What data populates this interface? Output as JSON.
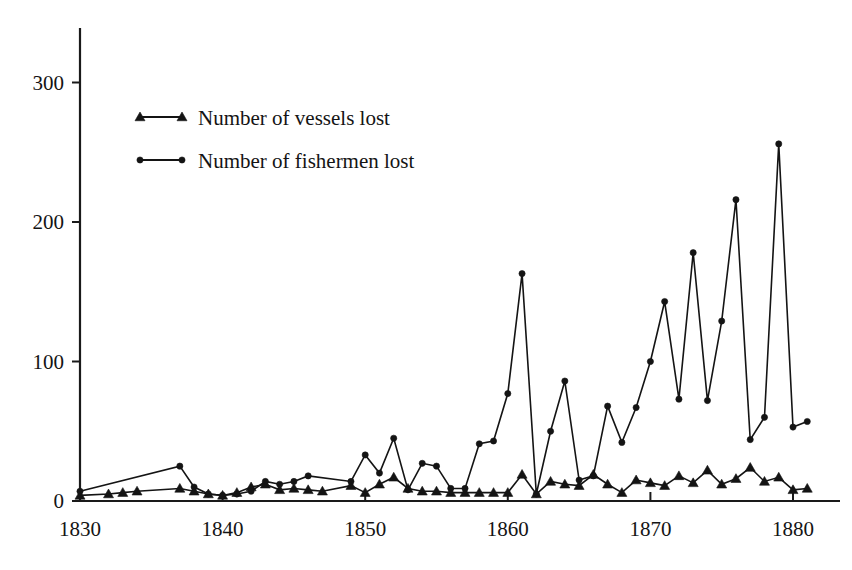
{
  "chart_data": {
    "type": "line",
    "title": "",
    "subtitle": "",
    "xlabel": "",
    "ylabel": "",
    "xlim": [
      1829,
      1882
    ],
    "ylim": [
      0,
      335
    ],
    "grid": false,
    "legend_position": "top-left-inside",
    "x_ticks": [
      1830,
      1840,
      1850,
      1860,
      1870,
      1880
    ],
    "x_tick_labels": [
      "1830",
      "1840",
      "1850",
      "1860",
      "1870",
      "1880"
    ],
    "y_ticks": [
      0,
      100,
      200,
      300
    ],
    "y_tick_labels": [
      "0",
      "100",
      "200",
      "300"
    ],
    "series": [
      {
        "name": "Number of vessels lost",
        "marker": "triangle",
        "color": "#141414",
        "x": [
          1830,
          1832,
          1833,
          1834,
          1837,
          1838,
          1839,
          1840,
          1841,
          1842,
          1843,
          1844,
          1845,
          1846,
          1847,
          1849,
          1850,
          1851,
          1852,
          1853,
          1854,
          1855,
          1856,
          1857,
          1858,
          1859,
          1860,
          1861,
          1862,
          1863,
          1864,
          1865,
          1866,
          1867,
          1868,
          1869,
          1870,
          1871,
          1872,
          1873,
          1874,
          1875,
          1876,
          1877,
          1878,
          1879,
          1880,
          1881
        ],
        "values": [
          4,
          5,
          6,
          7,
          9,
          7,
          5,
          4,
          6,
          10,
          12,
          8,
          9,
          8,
          7,
          11,
          6,
          12,
          17,
          9,
          7,
          7,
          6,
          6,
          6,
          6,
          6,
          19,
          5,
          14,
          12,
          11,
          19,
          12,
          6,
          15,
          13,
          11,
          18,
          13,
          22,
          12,
          16,
          24,
          14,
          17,
          8,
          9
        ]
      },
      {
        "name": "Number of fishermen lost",
        "marker": "circle",
        "color": "#141414",
        "x": [
          1830,
          1837,
          1838,
          1839,
          1840,
          1841,
          1842,
          1843,
          1844,
          1845,
          1846,
          1849,
          1850,
          1851,
          1852,
          1853,
          1854,
          1855,
          1856,
          1857,
          1858,
          1859,
          1860,
          1861,
          1862,
          1863,
          1864,
          1865,
          1866,
          1867,
          1868,
          1869,
          1870,
          1871,
          1872,
          1873,
          1874,
          1875,
          1876,
          1877,
          1878,
          1879,
          1880,
          1881
        ],
        "values": [
          7,
          25,
          10,
          5,
          4,
          5,
          7,
          14,
          12,
          14,
          18,
          14,
          33,
          20,
          45,
          8,
          27,
          25,
          9,
          9,
          41,
          43,
          77,
          163,
          5,
          50,
          86,
          15,
          18,
          68,
          42,
          67,
          100,
          143,
          73,
          178,
          72,
          129,
          216,
          44,
          60,
          256,
          53,
          57
        ]
      }
    ]
  },
  "legend": {
    "items": [
      {
        "label": "Number of vessels lost",
        "marker": "triangle"
      },
      {
        "label": "Number of fishermen lost",
        "marker": "circle"
      }
    ]
  }
}
